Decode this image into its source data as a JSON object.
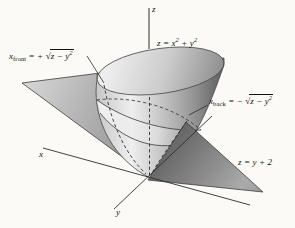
{
  "figure": {
    "type": "3d-math-diagram",
    "description_visible_text_only": true,
    "background": "#fbfaf6"
  },
  "labels": {
    "z_axis": "z",
    "x_axis": "x",
    "y_axis": "y",
    "plane_equation": "z = y + 2",
    "surface_equation": {
      "p1": "z = x",
      "s1": "2",
      "p2": " + y",
      "s2": "2"
    },
    "sqrt_sign": "√",
    "x_front": {
      "v": "x",
      "sub": "front",
      "eq": " = + ",
      "rad": "z − y",
      "radsup": "2"
    },
    "x_back": {
      "v": "x",
      "sub": "back",
      "eq": " = − ",
      "rad": "z − y",
      "radsup": "2"
    }
  },
  "colors": {
    "line": "#2e2e2e",
    "text": "#141414",
    "surface_highlight": "#efefef",
    "surface_dark": "#5f5f5f",
    "plane_gray": "#9b9b9b",
    "background": "#fbfaf6"
  }
}
